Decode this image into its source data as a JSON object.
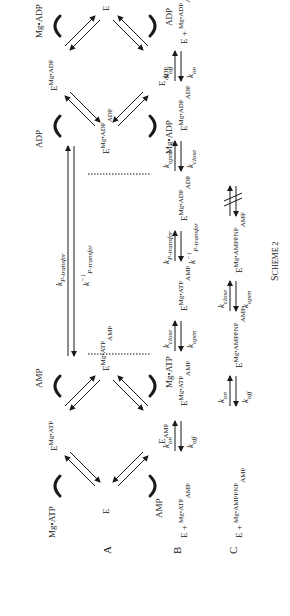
{
  "scheme": {
    "caption": "Scheme 2",
    "panels": {
      "A": {
        "label": "A",
        "left_cycle": {
          "free_enzyme": "E",
          "top_state": {
            "base": "E",
            "sup": "Mg•ATP"
          },
          "bottom_state": {
            "base": "E",
            "sub": "AMP"
          },
          "ternary": {
            "base": "E",
            "sup": "Mg•ATP",
            "sub": "AMP"
          },
          "ligands": [
            "Mg•ATP",
            "AMP",
            "AMP",
            "Mg•ATP"
          ]
        },
        "transfer": {
          "forward": "k",
          "forward_sub": "P-transfer",
          "reverse": "k",
          "reverse_sup": "−1",
          "reverse_sub": "P-transfer"
        },
        "right_cycle": {
          "ternary": {
            "base": "E",
            "sup": "Mg•ADP",
            "sub": "ADP"
          },
          "top_state": {
            "base": "E",
            "sup": "Mg•ADP"
          },
          "bottom_state": {
            "base": "E",
            "sub": "ADP"
          },
          "free_enzyme": "E",
          "ligands": [
            "ADP",
            "Mg•ADP",
            "Mg•ADP",
            "ADP"
          ]
        }
      },
      "B": {
        "label": "B",
        "steps": [
          {
            "species": "E + Mg•ATP / AMP"
          },
          {
            "k_fwd": "on",
            "k_rev": "off"
          },
          {
            "species": {
              "base": "E",
              "sup": "Mg•ATP",
              "sub": "AMP"
            }
          },
          {
            "k_fwd": "close",
            "k_rev": "open"
          },
          {
            "species": {
              "base": "E",
              "sup": "Mg•ATP",
              "sub": "AMP"
            }
          },
          {
            "k_fwd": "P-transfer",
            "k_rev": "P-transfer",
            "k_rev_sup": "−1"
          },
          {
            "species": {
              "base": "E",
              "sup": "Mg•ADP",
              "sub": "ADP"
            }
          },
          {
            "k_fwd": "open",
            "k_rev": "close"
          },
          {
            "species": {
              "base": "E",
              "sup": "Mg•ADP",
              "sub": "ADP"
            }
          },
          {
            "k_fwd": "off",
            "k_rev": "on"
          },
          {
            "species": "E + Mg•ADP / ADP"
          }
        ]
      },
      "C": {
        "label": "C",
        "steps": [
          {
            "species": "E + Mg•AMPPNP / AMP"
          },
          {
            "k_fwd": "on",
            "k_rev": "off"
          },
          {
            "species": {
              "base": "E",
              "sup": "Mg•AMPPNP",
              "sub": "AMP"
            }
          },
          {
            "k_fwd": "close",
            "k_rev": "open"
          },
          {
            "species": {
              "base": "E",
              "sup": "Mg•AMPPNP",
              "sub": "AMP"
            }
          },
          {
            "blocked": "no transfer"
          }
        ]
      }
    }
  },
  "txt": {
    "A": "A",
    "B": "B",
    "C": "C",
    "E": "E",
    "plus": "+",
    "MgATP": "Mg•ATP",
    "MgADP": "Mg•ADP",
    "AMP": "AMP",
    "ADP": "ADP",
    "MgAMPPNP": "Mg•AMPPNP",
    "k": "k",
    "on": "on",
    "off": "off",
    "open": "open",
    "close": "close",
    "ptransfer": "P-transfer",
    "m1": "−1",
    "caption_S": "S",
    "caption_rest": "CHEME 2"
  }
}
